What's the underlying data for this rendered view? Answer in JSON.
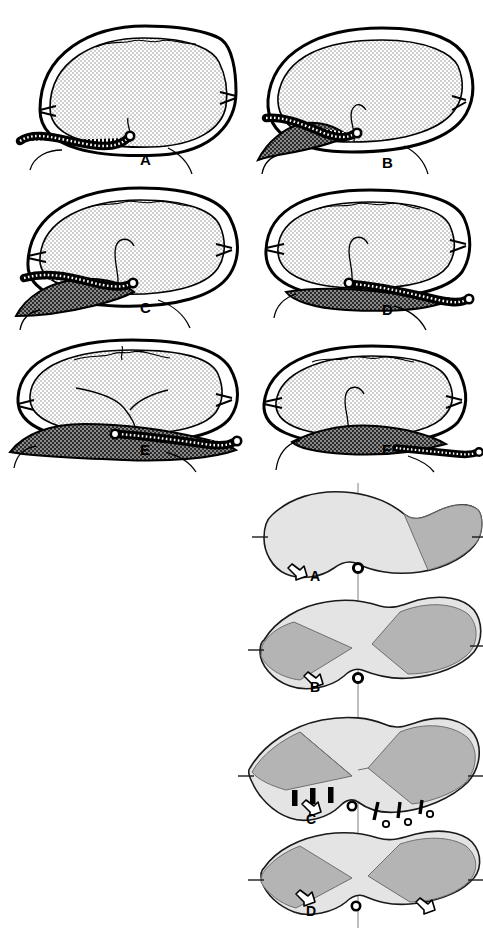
{
  "figure": {
    "title_text": "",
    "background_color": "#ffffff",
    "width": 483,
    "height": 930
  },
  "palette": {
    "outline": "#000000",
    "brain_fill": "#dcdcdc",
    "dark_collection": "#4d4d4d",
    "mid_gray_sector": "#b4b4b4",
    "light_gray_sector": "#dedede",
    "white": "#ffffff",
    "catheter_body": "#ffffff",
    "catheter_coil": "#000000"
  },
  "upper_figure": {
    "name": "coronal-skull-series",
    "rows": 3,
    "columns": 2,
    "panels": [
      {
        "id": "A",
        "label": "A",
        "label_x": 140,
        "label_y": 165,
        "description": "Coronal section, symmetric brain, no subdural collection, coiled catheter running along left convexity to midline",
        "has_dark_collection": false,
        "catheter_present": true,
        "catheter_side": "left",
        "midline_shift": "none"
      },
      {
        "id": "B",
        "label": "B",
        "label_x": 382,
        "label_y": 168,
        "description": "Coronal section with left subdural collection, brain displaced, catheter over collection crossing to midline",
        "has_dark_collection": true,
        "catheter_present": true,
        "catheter_side": "left",
        "midline_shift": "right"
      },
      {
        "id": "C",
        "label": "C",
        "label_x": 140,
        "label_y": 313,
        "description": "Coronal section with larger left subdural collection, catheter along collection to midline",
        "has_dark_collection": true,
        "catheter_present": true,
        "catheter_side": "left",
        "midline_shift": "right"
      },
      {
        "id": "D",
        "label": "D",
        "label_x": 382,
        "label_y": 315,
        "description": "Coronal section with basal subdural collection, catheter exits to the right side",
        "has_dark_collection": true,
        "catheter_present": true,
        "catheter_side": "right",
        "midline_shift": "none"
      },
      {
        "id": "E",
        "label": "E",
        "label_x": 140,
        "label_y": 455,
        "description": "Coronal section with bilateral basal collection, catheter along right inferior margin",
        "has_dark_collection": true,
        "catheter_present": true,
        "catheter_side": "right",
        "midline_shift": "none"
      },
      {
        "id": "F",
        "label": "F",
        "label_x": 382,
        "label_y": 455,
        "description": "Coronal section with central basal collection, catheter exiting right inferior",
        "has_dark_collection": true,
        "catheter_present": true,
        "catheter_side": "right",
        "midline_shift": "none"
      }
    ]
  },
  "lower_figure": {
    "name": "axial-brain-series",
    "rows": 4,
    "columns": 1,
    "has_midline_axis": true,
    "panels": [
      {
        "id": "A",
        "label": "A",
        "label_x": 316,
        "label_y": 578,
        "description": "Axial view, single right posterior shaded sector, midline marker at inferior midline, one open arrow on the left",
        "sectors": [
          {
            "side": "right",
            "shade": "mid",
            "position": "posterior-lateral"
          }
        ],
        "arrows": [
          {
            "x": 290,
            "y": 568,
            "direction": "up-left"
          }
        ],
        "markers": [
          "midline-node"
        ],
        "sutures": []
      },
      {
        "id": "B",
        "label": "B",
        "label_x": 316,
        "label_y": 688,
        "description": "Axial view, shaded sectors both sides, midline node, one open arrow on the left inferior border",
        "sectors": [
          {
            "side": "left",
            "shade": "mid",
            "position": "lateral"
          },
          {
            "side": "right",
            "shade": "mid",
            "position": "lateral"
          }
        ],
        "arrows": [
          {
            "x": 311,
            "y": 680,
            "direction": "up-left"
          }
        ],
        "markers": [
          "midline-node"
        ],
        "sutures": []
      },
      {
        "id": "C",
        "label": "C",
        "label_x": 316,
        "label_y": 820,
        "description": "Axial view with bilateral shaded sectors, three short solid bars on left inferior margin, three tethered sutures with open beads on right inferior margin, one open arrow on the left",
        "sectors": [
          {
            "side": "left",
            "shade": "mid",
            "position": "lateral"
          },
          {
            "side": "right",
            "shade": "mid",
            "position": "lateral"
          }
        ],
        "arrows": [
          {
            "x": 308,
            "y": 812,
            "direction": "up-left"
          }
        ],
        "markers": [
          "midline-node"
        ],
        "sutures": [
          {
            "side": "left",
            "type": "bar",
            "count": 3
          },
          {
            "side": "right",
            "type": "bar-with-bead",
            "count": 3
          }
        ]
      },
      {
        "id": "D",
        "label": "D",
        "label_x": 316,
        "label_y": 912,
        "description": "Axial view, bilateral shaded sectors, midline node, two open arrows at left and right inferior margins",
        "sectors": [
          {
            "side": "left",
            "shade": "mid",
            "position": "lateral"
          },
          {
            "side": "right",
            "shade": "mid",
            "position": "lateral"
          }
        ],
        "arrows": [
          {
            "x": 300,
            "y": 898,
            "direction": "up-left"
          },
          {
            "x": 420,
            "y": 903,
            "direction": "up-left"
          }
        ],
        "markers": [
          "midline-node"
        ],
        "sutures": []
      }
    ]
  }
}
